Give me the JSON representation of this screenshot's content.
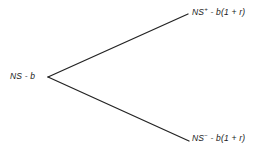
{
  "diagram": {
    "type": "binomial-tree",
    "background_color": "#ffffff",
    "line_color": "#232323",
    "text_color": "#1a1a1a",
    "root": {
      "text": "NS - b",
      "base": "NS",
      "superscript": "",
      "tail": " - b"
    },
    "branches": [
      {
        "name": "up-branch",
        "direction": "up",
        "from": {
          "x": 48,
          "y": 77
        },
        "to": {
          "x": 188,
          "y": 14
        },
        "label": {
          "base": "NS",
          "superscript": "+",
          "tail": " - b(1 + r)",
          "text": "NS+ - b(1 + r)"
        }
      },
      {
        "name": "down-branch",
        "direction": "down",
        "from": {
          "x": 48,
          "y": 77
        },
        "to": {
          "x": 189,
          "y": 141
        },
        "label": {
          "base": "NS",
          "superscript": "−",
          "tail": " - b(1 + r)",
          "text": "NS- - b(1 + r)"
        }
      }
    ]
  }
}
